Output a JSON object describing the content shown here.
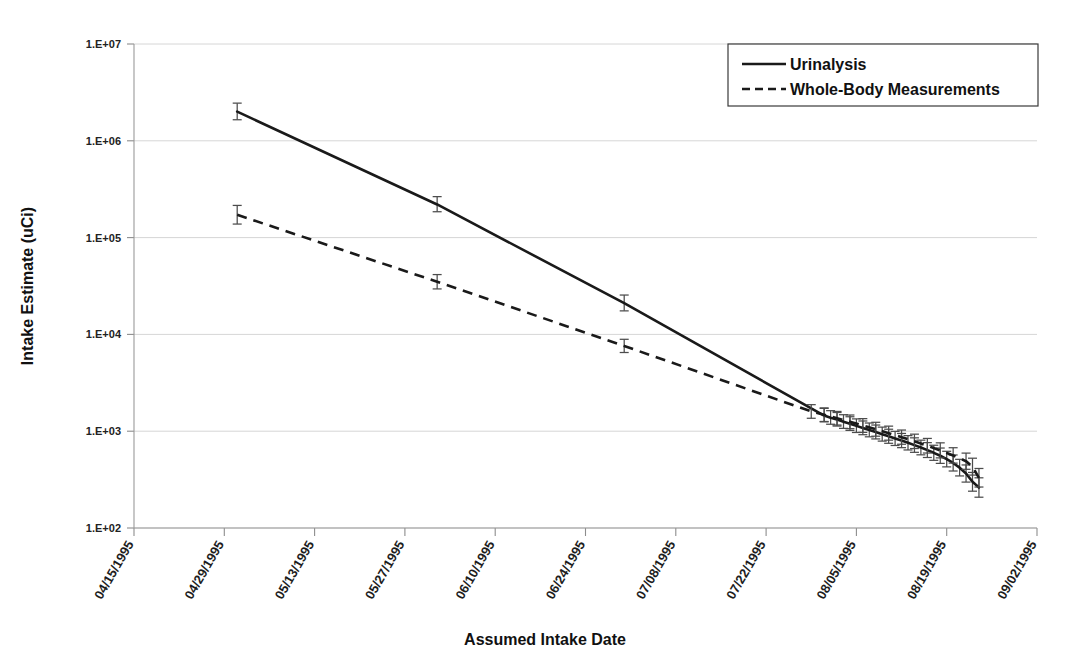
{
  "chart_data": {
    "type": "line",
    "title": "",
    "xlabel": "Assumed Intake Date",
    "ylabel": "Intake Estimate (uCi)",
    "yscale": "log",
    "ylim": [
      100,
      10000000
    ],
    "ytick_labels": [
      "1.E+07",
      "1.E+06",
      "1.E+05",
      "1.E+04",
      "1.E+03",
      "1.E+02"
    ],
    "ytick_values": [
      10000000,
      1000000,
      100000,
      10000,
      1000,
      100
    ],
    "grid": true,
    "legend_position": "top-right",
    "xtick_labels": [
      "04/15/1995",
      "04/29/1995",
      "05/13/1995",
      "05/27/1995",
      "06/10/1995",
      "06/24/1995",
      "07/08/1995",
      "07/22/1995",
      "08/05/1995",
      "08/19/1995",
      "09/02/1995"
    ],
    "xlim": [
      "04/15/1995",
      "09/02/1995"
    ],
    "xtick_interval_days": 14,
    "error_bars": true,
    "series": [
      {
        "name": "Urinalysis",
        "style": "solid",
        "color": "#1a1a1a",
        "points": [
          {
            "x": "05/01/1995",
            "y": 2000000,
            "yerr_low": 1650000,
            "yerr_high": 2450000
          },
          {
            "x": "06/01/1995",
            "y": 220000,
            "yerr_low": 185000,
            "yerr_high": 265000
          },
          {
            "x": "06/30/1995",
            "y": 21000,
            "yerr_low": 17500,
            "yerr_high": 25500
          },
          {
            "x": "07/31/1995",
            "y": 1450,
            "yerr_low": 1250,
            "yerr_high": 1720
          },
          {
            "x": "08/01/1995",
            "y": 1380,
            "yerr_low": 1180,
            "yerr_high": 1630
          },
          {
            "x": "08/02/1995",
            "y": 1320,
            "yerr_low": 1130,
            "yerr_high": 1560
          },
          {
            "x": "08/03/1995",
            "y": 1255,
            "yerr_low": 1070,
            "yerr_high": 1480
          },
          {
            "x": "08/04/1995",
            "y": 1195,
            "yerr_low": 1020,
            "yerr_high": 1410
          },
          {
            "x": "08/05/1995",
            "y": 1135,
            "yerr_low": 970,
            "yerr_high": 1340
          },
          {
            "x": "08/06/1995",
            "y": 1080,
            "yerr_low": 920,
            "yerr_high": 1275
          },
          {
            "x": "08/07/1995",
            "y": 1030,
            "yerr_low": 875,
            "yerr_high": 1215
          },
          {
            "x": "08/08/1995",
            "y": 980,
            "yerr_low": 832,
            "yerr_high": 1158
          },
          {
            "x": "08/09/1995",
            "y": 932,
            "yerr_low": 790,
            "yerr_high": 1102
          },
          {
            "x": "08/10/1995",
            "y": 886,
            "yerr_low": 750,
            "yerr_high": 1048
          },
          {
            "x": "08/11/1995",
            "y": 842,
            "yerr_low": 712,
            "yerr_high": 996
          },
          {
            "x": "08/12/1995",
            "y": 800,
            "yerr_low": 676,
            "yerr_high": 948
          },
          {
            "x": "08/13/1995",
            "y": 758,
            "yerr_low": 640,
            "yerr_high": 900
          },
          {
            "x": "08/14/1995",
            "y": 718,
            "yerr_low": 605,
            "yerr_high": 854
          },
          {
            "x": "08/15/1995",
            "y": 678,
            "yerr_low": 570,
            "yerr_high": 808
          },
          {
            "x": "08/16/1995",
            "y": 638,
            "yerr_low": 535,
            "yerr_high": 762
          },
          {
            "x": "08/17/1995",
            "y": 598,
            "yerr_low": 500,
            "yerr_high": 716
          },
          {
            "x": "08/18/1995",
            "y": 558,
            "yerr_low": 465,
            "yerr_high": 670
          },
          {
            "x": "08/19/1995",
            "y": 515,
            "yerr_low": 428,
            "yerr_high": 620
          },
          {
            "x": "08/20/1995",
            "y": 470,
            "yerr_low": 388,
            "yerr_high": 568
          },
          {
            "x": "08/21/1995",
            "y": 420,
            "yerr_low": 345,
            "yerr_high": 512
          },
          {
            "x": "08/22/1995",
            "y": 365,
            "yerr_low": 298,
            "yerr_high": 448
          },
          {
            "x": "08/23/1995",
            "y": 300,
            "yerr_low": 240,
            "yerr_high": 375
          },
          {
            "x": "08/24/1995",
            "y": 262,
            "yerr_low": 208,
            "yerr_high": 330
          }
        ]
      },
      {
        "name": "Whole-Body Measurements",
        "style": "dashed",
        "color": "#1a1a1a",
        "points": [
          {
            "x": "05/01/1995",
            "y": 172000,
            "yerr_low": 138000,
            "yerr_high": 215000
          },
          {
            "x": "06/01/1995",
            "y": 35000,
            "yerr_low": 29500,
            "yerr_high": 41500
          },
          {
            "x": "06/30/1995",
            "y": 7600,
            "yerr_low": 6500,
            "yerr_high": 8900
          },
          {
            "x": "07/29/1995",
            "y": 1600,
            "yerr_low": 1360,
            "yerr_high": 1880
          },
          {
            "x": "07/31/1995",
            "y": 1480,
            "yerr_low": 1260,
            "yerr_high": 1740
          },
          {
            "x": "08/02/1995",
            "y": 1360,
            "yerr_low": 1158,
            "yerr_high": 1600
          },
          {
            "x": "08/04/1995",
            "y": 1250,
            "yerr_low": 1062,
            "yerr_high": 1470
          },
          {
            "x": "08/06/1995",
            "y": 1145,
            "yerr_low": 972,
            "yerr_high": 1348
          },
          {
            "x": "08/08/1995",
            "y": 1048,
            "yerr_low": 888,
            "yerr_high": 1236
          },
          {
            "x": "08/10/1995",
            "y": 955,
            "yerr_low": 808,
            "yerr_high": 1128
          },
          {
            "x": "08/12/1995",
            "y": 868,
            "yerr_low": 733,
            "yerr_high": 1028
          },
          {
            "x": "08/14/1995",
            "y": 786,
            "yerr_low": 662,
            "yerr_high": 932
          },
          {
            "x": "08/16/1995",
            "y": 708,
            "yerr_low": 595,
            "yerr_high": 842
          },
          {
            "x": "08/18/1995",
            "y": 634,
            "yerr_low": 530,
            "yerr_high": 758
          },
          {
            "x": "08/20/1995",
            "y": 562,
            "yerr_low": 468,
            "yerr_high": 675
          },
          {
            "x": "08/22/1995",
            "y": 490,
            "yerr_low": 404,
            "yerr_high": 594
          },
          {
            "x": "08/23/1995",
            "y": 430,
            "yerr_low": 352,
            "yerr_high": 526
          },
          {
            "x": "08/24/1995",
            "y": 330,
            "yerr_low": 265,
            "yerr_high": 412
          }
        ]
      }
    ]
  },
  "legend": {
    "entries": [
      {
        "label": "Urinalysis",
        "style": "solid"
      },
      {
        "label": "Whole-Body Measurements",
        "style": "dashed"
      }
    ]
  }
}
